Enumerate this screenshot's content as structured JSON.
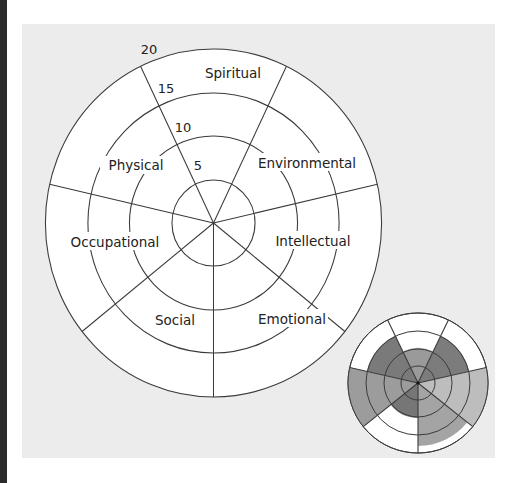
{
  "diagram": {
    "scale": {
      "max": 20,
      "rings": [
        5,
        10,
        15,
        20
      ],
      "ring_labels": [
        "5",
        "10",
        "15",
        "20"
      ]
    },
    "dimensions": [
      {
        "name": "Spiritual"
      },
      {
        "name": "Environmental"
      },
      {
        "name": "Intellectual"
      },
      {
        "name": "Emotional"
      },
      {
        "name": "Social"
      },
      {
        "name": "Occupational"
      },
      {
        "name": "Physical"
      }
    ],
    "example_wheel": {
      "description": "Filled-in example wheel (shaded scores)",
      "scores": [
        {
          "dimension": "Spiritual",
          "value": 10,
          "color": "#9a9a9a"
        },
        {
          "dimension": "Environmental",
          "value": 15,
          "color": "#7c7c7c"
        },
        {
          "dimension": "Intellectual",
          "value": 20,
          "color": "#bdbdbd"
        },
        {
          "dimension": "Emotional",
          "value": 18,
          "color": "#a4a4a4"
        },
        {
          "dimension": "Social",
          "value": 10,
          "color": "#767676"
        },
        {
          "dimension": "Occupational",
          "value": 20,
          "color": "#9c9c9c"
        },
        {
          "dimension": "Physical",
          "value": 15,
          "color": "#7a7a7a"
        }
      ]
    },
    "colors": {
      "panel": "#ececec",
      "wheel_fill": "#ffffff",
      "line": "#3a3a3a",
      "edge_bar": "#2b2b2b"
    }
  }
}
